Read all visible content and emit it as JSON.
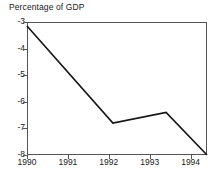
{
  "chart_data": {
    "type": "line",
    "title": "Percentage of GDP",
    "xlabel": "",
    "ylabel": "",
    "grid": false,
    "legend": null,
    "legend_position": "none",
    "xlim": [
      1990,
      1994.4
    ],
    "ylim": [
      -8,
      -3
    ],
    "y_axis_inverted_display": true,
    "xticks": [
      1990,
      1991,
      1992,
      1993,
      1994
    ],
    "xticklabels": [
      "1990",
      "1991",
      "1992",
      "1993",
      "1994"
    ],
    "yticks": [
      -3,
      -4,
      -5,
      -6,
      -7,
      -8
    ],
    "yticklabels": [
      "-3",
      "-4",
      "-5",
      "-6",
      "-7",
      "-8"
    ],
    "series": [
      {
        "name": "Budget balance",
        "color": "#141414",
        "x": [
          1990.0,
          1992.1,
          1993.4,
          1994.4
        ],
        "values": [
          -3.15,
          -6.8,
          -6.4,
          -8.0
        ]
      }
    ]
  },
  "axes": {
    "title": "Percentage of GDP",
    "y_ticks": [
      {
        "label": "-3",
        "value": -3
      },
      {
        "label": "-4",
        "value": -4
      },
      {
        "label": "-5",
        "value": -5
      },
      {
        "label": "-6",
        "value": -6
      },
      {
        "label": "-7",
        "value": -7
      },
      {
        "label": "-8",
        "value": -8
      }
    ],
    "x_ticks": [
      {
        "label": "1990",
        "value": 1990
      },
      {
        "label": "1991",
        "value": 1991
      },
      {
        "label": "1992",
        "value": 1992
      },
      {
        "label": "1993",
        "value": 1993
      },
      {
        "label": "1994",
        "value": 1994
      }
    ]
  },
  "colors": {
    "line": "#141414",
    "frame": "#555555",
    "text": "#1a1a1a",
    "background": "#ffffff"
  }
}
